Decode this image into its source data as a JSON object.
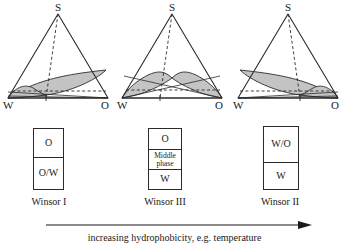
{
  "figure": {
    "panels": [
      {
        "id": "winsor-1",
        "apex_label": "S",
        "left_label": "W",
        "right_label": "O",
        "tube": {
          "caption": "Winsor I",
          "cells": [
            {
              "label": "O",
              "size": "normal"
            },
            {
              "label": "O/W",
              "size": "normal"
            }
          ]
        }
      },
      {
        "id": "winsor-3",
        "apex_label": "S",
        "left_label": "W",
        "right_label": "O",
        "tube": {
          "caption": "Winsor III",
          "cells": [
            {
              "label": "O",
              "size": "normal"
            },
            {
              "label": "Middle\nphase",
              "size": "small"
            },
            {
              "label": "W",
              "size": "normal"
            }
          ]
        }
      },
      {
        "id": "winsor-2",
        "apex_label": "S",
        "left_label": "W",
        "right_label": "O",
        "tube": {
          "caption": "Winsor II",
          "cells": [
            {
              "label": "W/O",
              "size": "normal"
            },
            {
              "label": "W",
              "size": "normal"
            }
          ]
        }
      }
    ],
    "axis_arrow": {
      "caption": "increasing hydrophobicity, e.g. temperature",
      "direction": "right"
    },
    "colors": {
      "stroke": "#2b2b2b",
      "shade_fill": "#c4c4c4",
      "background": "#ffffff"
    }
  }
}
